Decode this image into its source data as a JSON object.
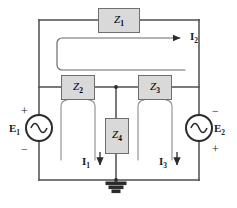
{
  "diagram": {
    "type": "electrical-schematic",
    "background_color": "#ffffff",
    "wire_color": "#4d4d4d",
    "box_fill_color": "#d9d9d9",
    "box_border_color": "#6e6e6e",
    "text_color": "#1a1a1a"
  },
  "impedances": [
    {
      "id": "z1",
      "label": "Z",
      "subscript": "1",
      "x": 98,
      "y": 8,
      "w": 42,
      "h": 25
    },
    {
      "id": "z2",
      "label": "Z",
      "subscript": "2",
      "x": 61,
      "y": 75,
      "w": 34,
      "h": 25
    },
    {
      "id": "z3",
      "label": "Z",
      "subscript": "3",
      "x": 138,
      "y": 75,
      "w": 34,
      "h": 25
    },
    {
      "id": "z4",
      "label": "Z",
      "subscript": "4",
      "x": 105,
      "y": 118,
      "w": 24,
      "h": 36
    }
  ],
  "sources": [
    {
      "id": "e1",
      "label": "E",
      "subscript": "1",
      "cx": 39,
      "cy": 128,
      "r": 13,
      "top_sign": "+",
      "bottom_sign": "−",
      "label_side": "left"
    },
    {
      "id": "e2",
      "label": "E",
      "subscript": "2",
      "cx": 199,
      "cy": 128,
      "r": 13,
      "top_sign": "−",
      "bottom_sign": "+",
      "label_side": "right"
    }
  ],
  "currents": [
    {
      "id": "i1",
      "label": "I",
      "subscript": "1",
      "x": 82,
      "y": 157,
      "direction": "down"
    },
    {
      "id": "i2",
      "label": "I",
      "subscript": "2",
      "x": 190,
      "y": 32,
      "direction": "right"
    },
    {
      "id": "i3",
      "label": "I",
      "subscript": "3",
      "x": 159,
      "y": 157,
      "direction": "down"
    }
  ],
  "ground": {
    "id": "ground",
    "name": "ground-symbol",
    "x": 116,
    "y": 180
  },
  "nodes": {
    "top_rail_y": 20,
    "mid_rail_y": 87,
    "bottom_rail_y": 180,
    "left_rail_x": 39,
    "right_rail_x": 199,
    "center_x": 116
  }
}
